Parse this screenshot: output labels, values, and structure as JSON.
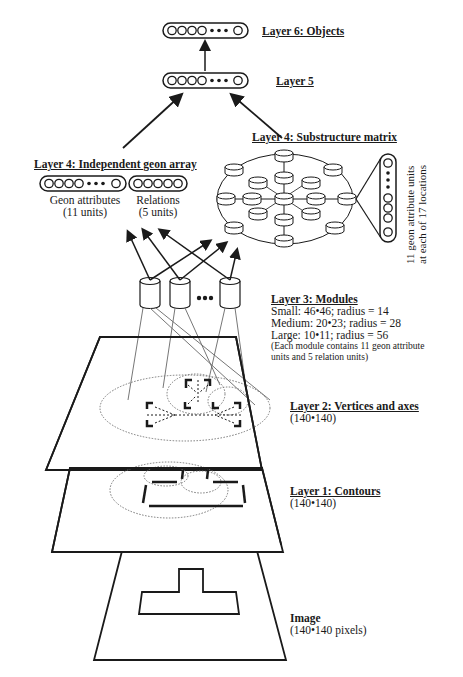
{
  "layers": {
    "layer6": {
      "title": "Layer 6: Objects"
    },
    "layer5": {
      "title": "Layer 5"
    },
    "layer4_independent": {
      "title": "Layer 4: Independent geon array",
      "geon_attributes": {
        "label": "Geon attributes",
        "units": "(11 units)"
      },
      "relations": {
        "label": "Relations",
        "units": "(5 units)"
      }
    },
    "layer4_substructure": {
      "title": "Layer 4: Substructure matrix",
      "note_line1": "11 geon attribute units",
      "note_line2": "at each of 17 locations"
    },
    "layer3": {
      "title": "Layer 3:  Modules",
      "small": "Small: 46•46; radius = 14",
      "medium": "Medium: 20•23; radius = 28",
      "large": "Large: 10•11; radius = 56",
      "note_line1": "(Each module contains 11 geon attribute",
      "note_line2": "units and 5 relation units)"
    },
    "layer2": {
      "title": "Layer 2: Vertices and axes",
      "size": "(140•140)"
    },
    "layer1": {
      "title": "Layer 1: Contours",
      "size": "(140•140)"
    },
    "image": {
      "title": "Image",
      "size": "(140•140 pixels)"
    }
  },
  "glyphs": {
    "ellipsis": "•••"
  },
  "colors": {
    "ink": "#1a1a1a",
    "dotted": "#555555",
    "background": "#ffffff"
  }
}
